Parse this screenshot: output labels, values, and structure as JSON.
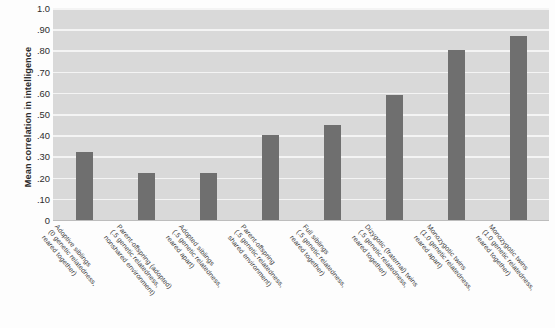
{
  "chart_data": {
    "type": "bar",
    "title": "",
    "xlabel": "",
    "ylabel": "Mean correlation in intelligence",
    "ylim": [
      0,
      1.0
    ],
    "grid": true,
    "legend": "none",
    "ytick_labels": [
      "1.0",
      ".90",
      ".80",
      ".70",
      ".60",
      ".50",
      ".40",
      ".30",
      ".20",
      ".10",
      "0"
    ],
    "ytick_values": [
      1.0,
      0.9,
      0.8,
      0.7,
      0.6,
      0.5,
      0.4,
      0.3,
      0.2,
      0.1,
      0
    ],
    "categories": [
      "Adoptive siblings (0 genetic relatedness, reared together)",
      "Parent-offspring (adopted) (.5 genetic relatedness, nonshared environment)",
      "Adopted siblings (.5 genetic relatedness, reared apart)",
      "Parent-offspring (.5 genetic relatedness, shared environment)",
      "Full siblings (.5 genetic relatedness, reared together)",
      "Dizygotic (fraternal) twins (.5 genetic relatedness, reared together)",
      "Monozygotic twins (1.0 genetic relatedness, reared apart)",
      "Monozygotic twins (1.0 genetic relatedness, reared together)"
    ],
    "values": [
      0.32,
      0.22,
      0.22,
      0.4,
      0.45,
      0.59,
      0.8,
      0.87
    ],
    "bar_color": "#6f6f6f",
    "plot_background": "#d9d9d9",
    "gridline_color": "#f4f4f4"
  },
  "x_labels": [
    {
      "l1": "Adoptive siblings",
      "l2": "(0 genetic relatedness,",
      "l3": "reared together)"
    },
    {
      "l1": "Parent-offspring (adopted)",
      "l2": "(.5 genetic relatedness,",
      "l3": "nonshared environment)"
    },
    {
      "l1": "Adopted siblings",
      "l2": "(.5 genetic relatedness,",
      "l3": "reared apart)"
    },
    {
      "l1": "Parent-offspring",
      "l2": "(.5 genetic relatedness,",
      "l3": "shared environment)"
    },
    {
      "l1": "Full siblings",
      "l2": "(.5 genetic relatedness,",
      "l3": "reared together)"
    },
    {
      "l1": "Dizygotic (fraternal) twins",
      "l2": "(.5 genetic relatedness,",
      "l3": "reared together)"
    },
    {
      "l1": "Monozygotic twins",
      "l2": "(1.0 genetic relatedness,",
      "l3": "reared apart)"
    },
    {
      "l1": "Monozygotic twins",
      "l2": "(1.0 genetic relatedness,",
      "l3": "reared together)"
    }
  ]
}
